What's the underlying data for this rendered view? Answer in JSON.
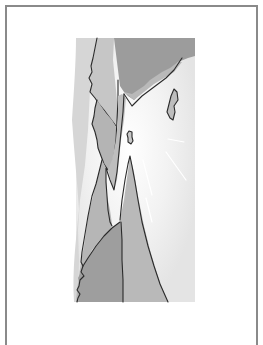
{
  "page": {
    "type": "framed-illustration"
  },
  "illustration": {
    "style": "grayscale line art with flat fills",
    "regions": [
      {
        "id": "sky-haze",
        "label": "pale sky haze",
        "color": "#e6e6e6"
      },
      {
        "id": "far-left-cliff",
        "label": "far left cliff face",
        "color": "#c4c4c4"
      },
      {
        "id": "upper-right-mass",
        "label": "upper right dark rock mass",
        "color": "#9a9a9a"
      },
      {
        "id": "mid-left-cliff",
        "label": "middle left cliff",
        "color": "#b2b2b2"
      },
      {
        "id": "central-spire",
        "label": "central spire",
        "color": "#b8b8b8"
      },
      {
        "id": "lower-left-rock",
        "label": "lower left dark rock",
        "color": "#9c9c9c"
      },
      {
        "id": "floating-rock-right",
        "label": "floating rock right",
        "color": "#bcbcbc"
      },
      {
        "id": "floating-rock-small",
        "label": "small floating rock",
        "color": "#c8c8c8"
      },
      {
        "id": "light-rays",
        "label": "light rays",
        "color": "#ffffff"
      }
    ],
    "palette": {
      "frame": "#8a8a8a",
      "ink": "#2a2a2a",
      "glow": "#ffffff"
    }
  }
}
